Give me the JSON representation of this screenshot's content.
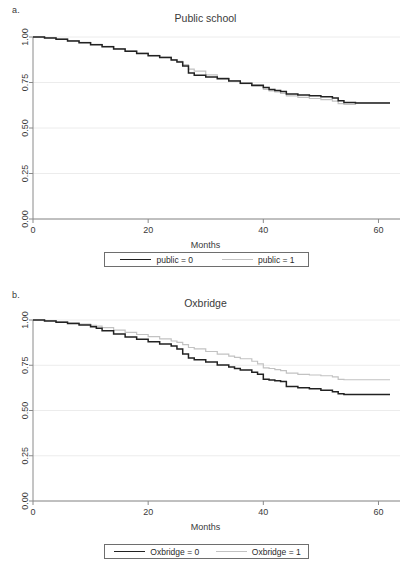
{
  "figure": {
    "background": "#ffffff",
    "line_color_dark": "#222222",
    "line_color_light": "#c2c2c2",
    "grid_color": "#ececec",
    "axis_color": "#8a8a8a"
  },
  "panels": [
    {
      "letter": "a.",
      "title": "Public school",
      "xlabel": "Months",
      "legend": [
        {
          "label": "public = 0",
          "style": "dark"
        },
        {
          "label": "public = 1",
          "style": "light"
        }
      ]
    },
    {
      "letter": "b.",
      "title": "Oxbridge",
      "xlabel": "Months",
      "legend": [
        {
          "label": "Oxbridge = 0",
          "style": "dark"
        },
        {
          "label": "Oxbridge = 1",
          "style": "light"
        }
      ]
    }
  ],
  "chart_data": [
    {
      "type": "line",
      "title": "Public school",
      "xlabel": "Months",
      "ylabel": "",
      "xlim": [
        0,
        62
      ],
      "ylim": [
        0,
        1.0
      ],
      "xticks": [
        0,
        20,
        40,
        60
      ],
      "xticklabels": [
        "0",
        "20",
        "40",
        "60"
      ],
      "yticks": [
        0.0,
        0.25,
        0.5,
        0.75,
        1.0
      ],
      "yticklabels": [
        "0.00",
        "0.25",
        "0.50",
        "0.75",
        "1.00"
      ],
      "grid": "horizontal",
      "legend_position": "below-axis",
      "series": [
        {
          "name": "public = 0",
          "color": "#222222",
          "x": [
            0,
            2,
            4,
            6,
            8,
            10,
            12,
            14,
            16,
            18,
            20,
            22,
            24,
            25,
            26,
            27,
            28,
            30,
            32,
            34,
            36,
            38,
            40,
            41,
            42,
            43,
            44,
            46,
            48,
            50,
            52,
            53,
            54,
            56,
            58,
            60,
            62
          ],
          "y": [
            1.0,
            0.995,
            0.988,
            0.978,
            0.968,
            0.958,
            0.946,
            0.934,
            0.922,
            0.91,
            0.897,
            0.887,
            0.873,
            0.862,
            0.84,
            0.802,
            0.79,
            0.78,
            0.77,
            0.758,
            0.746,
            0.735,
            0.722,
            0.712,
            0.706,
            0.7,
            0.687,
            0.682,
            0.677,
            0.672,
            0.665,
            0.65,
            0.64,
            0.638,
            0.638,
            0.638,
            0.638
          ]
        },
        {
          "name": "public = 1",
          "color": "#c2c2c2",
          "x": [
            0,
            2,
            4,
            6,
            8,
            10,
            12,
            14,
            16,
            18,
            20,
            22,
            24,
            25,
            26,
            27,
            28,
            30,
            32,
            34,
            36,
            38,
            40,
            41,
            42,
            43,
            44,
            46,
            48,
            50,
            52,
            53,
            54,
            56,
            58,
            60,
            62
          ],
          "y": [
            1.0,
            0.996,
            0.99,
            0.98,
            0.97,
            0.96,
            0.948,
            0.936,
            0.924,
            0.912,
            0.899,
            0.889,
            0.876,
            0.866,
            0.848,
            0.824,
            0.812,
            0.792,
            0.776,
            0.76,
            0.744,
            0.728,
            0.712,
            0.704,
            0.698,
            0.69,
            0.676,
            0.668,
            0.662,
            0.656,
            0.648,
            0.634,
            0.63,
            0.638,
            0.638,
            0.638,
            0.638
          ]
        }
      ]
    },
    {
      "type": "line",
      "title": "Oxbridge",
      "xlabel": "Months",
      "ylabel": "",
      "xlim": [
        0,
        62
      ],
      "ylim": [
        0,
        1.0
      ],
      "xticks": [
        0,
        20,
        40,
        60
      ],
      "xticklabels": [
        "0",
        "20",
        "40",
        "60"
      ],
      "yticks": [
        0.0,
        0.25,
        0.5,
        0.75,
        1.0
      ],
      "yticklabels": [
        "0.00",
        "0.25",
        "0.50",
        "0.75",
        "1.00"
      ],
      "grid": "horizontal",
      "legend_position": "below-axis",
      "series": [
        {
          "name": "Oxbridge = 0",
          "color": "#222222",
          "x": [
            0,
            2,
            4,
            6,
            8,
            10,
            11,
            12,
            14,
            16,
            18,
            20,
            22,
            24,
            25,
            26,
            27,
            28,
            30,
            32,
            34,
            35,
            36,
            38,
            39,
            40,
            41,
            42,
            43,
            44,
            46,
            48,
            50,
            52,
            53,
            54,
            56,
            58,
            60,
            62
          ],
          "y": [
            1.0,
            0.995,
            0.988,
            0.98,
            0.972,
            0.963,
            0.955,
            0.94,
            0.922,
            0.906,
            0.893,
            0.88,
            0.868,
            0.856,
            0.84,
            0.812,
            0.79,
            0.78,
            0.768,
            0.752,
            0.74,
            0.732,
            0.724,
            0.712,
            0.7,
            0.672,
            0.668,
            0.664,
            0.66,
            0.632,
            0.626,
            0.62,
            0.612,
            0.604,
            0.592,
            0.588,
            0.588,
            0.588,
            0.588,
            0.588
          ]
        },
        {
          "name": "Oxbridge = 1",
          "color": "#c2c2c2",
          "x": [
            0,
            2,
            4,
            6,
            8,
            10,
            11,
            12,
            14,
            16,
            18,
            20,
            22,
            24,
            25,
            26,
            27,
            28,
            30,
            32,
            34,
            35,
            36,
            38,
            39,
            40,
            41,
            42,
            43,
            44,
            46,
            48,
            50,
            52,
            53,
            54,
            56,
            58,
            60,
            62
          ],
          "y": [
            1.0,
            0.996,
            0.991,
            0.984,
            0.977,
            0.97,
            0.966,
            0.958,
            0.944,
            0.932,
            0.92,
            0.908,
            0.896,
            0.884,
            0.876,
            0.864,
            0.848,
            0.84,
            0.826,
            0.812,
            0.8,
            0.794,
            0.786,
            0.772,
            0.758,
            0.736,
            0.732,
            0.726,
            0.72,
            0.706,
            0.7,
            0.696,
            0.692,
            0.686,
            0.672,
            0.67,
            0.67,
            0.67,
            0.67,
            0.67
          ]
        }
      ]
    }
  ]
}
